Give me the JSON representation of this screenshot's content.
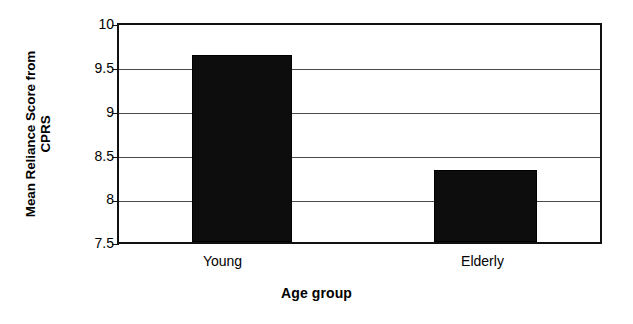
{
  "chart_data": {
    "type": "bar",
    "title": "",
    "subtitle": "",
    "categories": [
      "Young",
      "Elderly"
    ],
    "values": [
      9.65,
      8.33
    ],
    "series": [
      {
        "name": "Mean Reliance Score from CPRS",
        "values": [
          9.65,
          8.33
        ]
      }
    ],
    "xlabel": "Age group",
    "ylabel": "Mean Reliance Score from CPRS",
    "ylabel_line1": "Mean Reliance Score from",
    "ylabel_line2": "CPRS",
    "ylim": [
      7.5,
      10
    ],
    "ytick_labels": [
      "10",
      "9.5",
      "9",
      "8.5",
      "8",
      "7.5"
    ],
    "ytick_values": [
      10,
      9.5,
      9,
      8.5,
      8,
      7.5
    ],
    "grid": true,
    "grid_axis": "y",
    "legend": false,
    "legend_position": "none",
    "bar_color": "#0d0d0d",
    "axis_color": "#111111",
    "grid_color": "#4a4a4a",
    "background_color": "#ffffff"
  }
}
